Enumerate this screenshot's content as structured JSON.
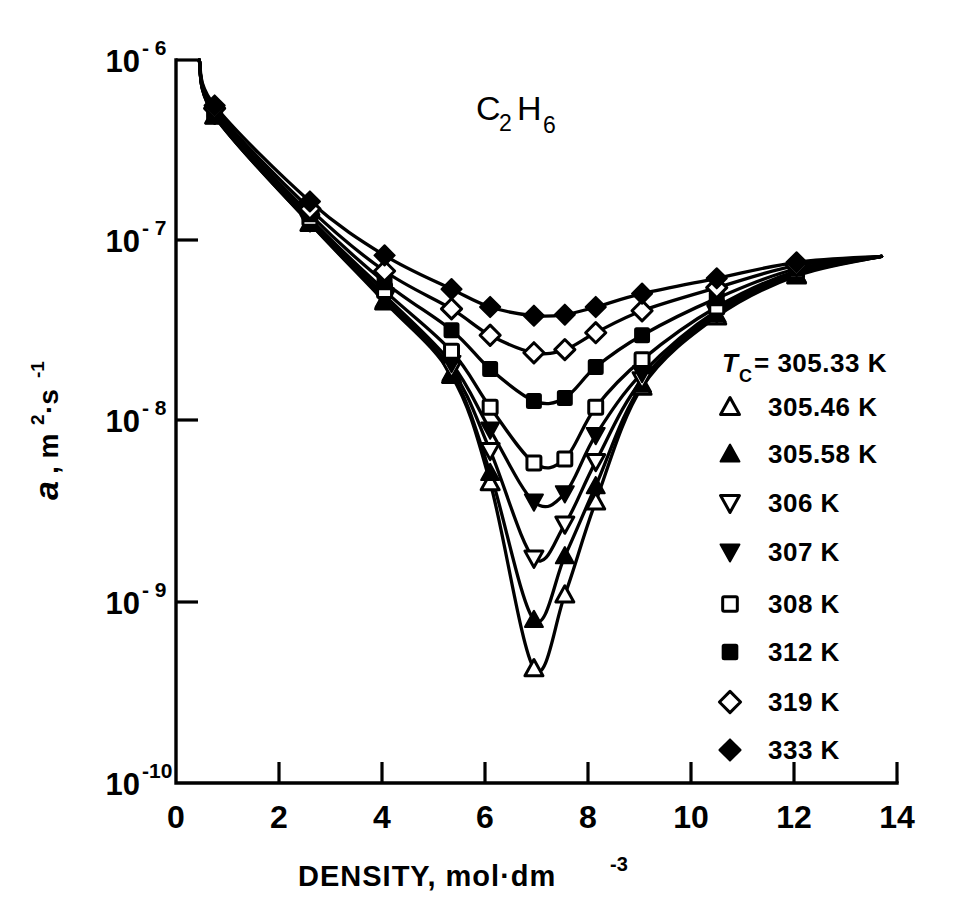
{
  "chart_data": {
    "type": "line",
    "title_display": {
      "element": "C",
      "sub1": "2",
      "element2": "H",
      "sub2": "6"
    },
    "xlabel": "DENSITY, mol·dm⁻³",
    "xlabel_parts": {
      "text": "DENSITY, mol·dm",
      "sup": "-3"
    },
    "ylabel": "a, m²·s⁻¹",
    "ylabel_parts": {
      "sym": "a",
      "mid": ", m",
      "sup1": "2",
      "mid2": "·s",
      "sup2": "-1"
    },
    "xlim": [
      0,
      14
    ],
    "ylim": [
      1e-10,
      1e-06
    ],
    "yscale": "log",
    "xscale": "linear",
    "xticks": [
      "0",
      "2",
      "4",
      "6",
      "8",
      "10",
      "12",
      "14"
    ],
    "xtick_values": [
      0,
      2,
      4,
      6,
      8,
      10,
      12,
      14
    ],
    "yticks": [
      "10-6",
      "10-7",
      "10-8",
      "10-9",
      "10-10"
    ],
    "ytick_values": [
      1e-06,
      1e-07,
      1e-08,
      1e-09,
      1e-10
    ],
    "ytick_mantissa": "10",
    "ytick_exponents": [
      "- 6",
      "- 7",
      "- 8",
      "- 9",
      "-10"
    ],
    "grid": false,
    "legend_position": "right-middle",
    "legend_header": {
      "symbol": "T",
      "sub": "C",
      "eq": "= 305.33 K"
    },
    "series": [
      {
        "name": "305.46 K",
        "marker": "triangle-up-open",
        "x": [
          0.75,
          2.6,
          4.05,
          5.35,
          6.1,
          6.95,
          7.55,
          8.15,
          9.05,
          10.5,
          12.05
        ],
        "y": [
          4.9e-07,
          1.25e-07,
          4.6e-08,
          1.8e-08,
          4.6e-09,
          4.3e-10,
          1.1e-09,
          3.6e-09,
          1.55e-08,
          3.8e-08,
          6.4e-08
        ]
      },
      {
        "name": "305.58 K",
        "marker": "triangle-up-filled",
        "x": [
          0.75,
          2.6,
          4.05,
          5.35,
          6.1,
          6.95,
          7.55,
          8.15,
          9.05,
          10.5,
          12.05
        ],
        "y": [
          4.9e-07,
          1.25e-07,
          4.7e-08,
          1.85e-08,
          5.2e-09,
          8e-10,
          1.8e-09,
          4.4e-09,
          1.6e-08,
          3.9e-08,
          6.5e-08
        ]
      },
      {
        "name": "306 K",
        "marker": "triangle-down-open",
        "x": [
          0.75,
          2.6,
          4.05,
          5.35,
          6.1,
          6.95,
          7.55,
          8.15,
          9.05,
          10.5,
          12.05
        ],
        "y": [
          5e-07,
          1.27e-07,
          4.8e-08,
          1.95e-08,
          6.9e-09,
          1.75e-09,
          2.7e-09,
          6e-09,
          1.7e-08,
          4e-08,
          6.6e-08
        ]
      },
      {
        "name": "307 K",
        "marker": "triangle-down-filled",
        "x": [
          0.75,
          2.6,
          4.05,
          5.35,
          6.1,
          6.95,
          7.55,
          8.15,
          9.05,
          10.5,
          12.05
        ],
        "y": [
          5e-07,
          1.3e-07,
          5e-08,
          2.1e-08,
          9e-09,
          3.6e-09,
          4e-09,
          8.4e-09,
          1.85e-08,
          4.1e-08,
          6.7e-08
        ]
      },
      {
        "name": "308 K",
        "marker": "square-open",
        "x": [
          0.75,
          2.6,
          4.05,
          5.35,
          6.1,
          6.95,
          7.55,
          8.15,
          9.05,
          10.5,
          12.05
        ],
        "y": [
          5.1e-07,
          1.33e-07,
          5.3e-08,
          2.45e-08,
          1.2e-08,
          5.9e-09,
          6.2e-09,
          1.2e-08,
          2.2e-08,
          4.3e-08,
          6.8e-08
        ]
      },
      {
        "name": "312 K",
        "marker": "square-filled",
        "x": [
          0.75,
          2.6,
          4.05,
          5.35,
          6.1,
          6.95,
          7.55,
          8.15,
          9.05,
          10.5,
          12.05
        ],
        "y": [
          5.2e-07,
          1.4e-07,
          5.9e-08,
          3.2e-08,
          1.95e-08,
          1.3e-08,
          1.35e-08,
          2e-08,
          3e-08,
          4.8e-08,
          7e-08
        ]
      },
      {
        "name": "319 K",
        "marker": "diamond-open",
        "x": [
          0.75,
          2.6,
          4.05,
          5.35,
          6.1,
          6.95,
          7.55,
          8.15,
          9.05,
          10.5,
          12.05
        ],
        "y": [
          5.4e-07,
          1.5e-07,
          6.8e-08,
          4.2e-08,
          3e-08,
          2.4e-08,
          2.5e-08,
          3.1e-08,
          4.1e-08,
          5.5e-08,
          7.3e-08
        ]
      },
      {
        "name": "333 K",
        "marker": "diamond-filled",
        "x": [
          0.75,
          2.6,
          4.05,
          5.35,
          6.1,
          6.95,
          7.55,
          8.15,
          9.05,
          10.5,
          12.05
        ],
        "y": [
          5.6e-07,
          1.65e-07,
          8.3e-08,
          5.4e-08,
          4.3e-08,
          3.85e-08,
          3.9e-08,
          4.3e-08,
          5.1e-08,
          6.2e-08,
          7.6e-08
        ]
      }
    ],
    "legend_entries": [
      {
        "marker": "none",
        "label": "= 305.33 K",
        "prefix": "T",
        "prefix_sub": "C"
      },
      {
        "marker": "triangle-up-open",
        "label": "305.46 K"
      },
      {
        "marker": "triangle-up-filled",
        "label": "305.58 K"
      },
      {
        "marker": "triangle-down-open",
        "label": "306 K"
      },
      {
        "marker": "triangle-down-filled",
        "label": "307 K"
      },
      {
        "marker": "square-open",
        "label": "308 K"
      },
      {
        "marker": "square-filled",
        "label": "312 K"
      },
      {
        "marker": "diamond-open",
        "label": "319 K"
      },
      {
        "marker": "diamond-filled",
        "label": "333 K"
      }
    ]
  },
  "colors": {
    "ink": "#000000",
    "paper": "#ffffff"
  }
}
